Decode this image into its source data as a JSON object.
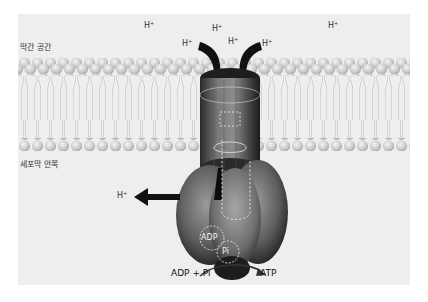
{
  "diagram": {
    "type": "ATP synthase in membrane",
    "regions": {
      "intermembrane_space": "막간 공간",
      "matrix_side": "세포막 안쪽"
    },
    "protons": [
      {
        "id": "h1",
        "label": "H",
        "charge": "+",
        "x": 146,
        "y": 26
      },
      {
        "id": "h2",
        "label": "H",
        "charge": "+",
        "x": 184,
        "y": 44
      },
      {
        "id": "h3",
        "label": "H",
        "charge": "+",
        "x": 214,
        "y": 29
      },
      {
        "id": "h4",
        "label": "H",
        "charge": "+",
        "x": 229,
        "y": 41
      },
      {
        "id": "h5",
        "label": "H",
        "charge": "+",
        "x": 262,
        "y": 44
      },
      {
        "id": "h6",
        "label": "H",
        "charge": "+",
        "x": 328,
        "y": 26
      },
      {
        "id": "h7",
        "label": "H",
        "charge": "+",
        "x": 117,
        "y": 190
      }
    ],
    "molecules": {
      "adp_inner": "ADP",
      "pi_inner": "Pi",
      "substrate": "ADP + Pi",
      "product": "ATP"
    },
    "colors": {
      "background": "#ffffff",
      "panel": "#eeeeee",
      "membrane_head": "#cfcfcf",
      "membrane_tail": "#bdbdbd",
      "enzyme_dark": "#2a2a2a",
      "enzyme_mid": "#6b6b6b",
      "enzyme_light": "#9a9a9a",
      "arrow": "#111111",
      "text": "#333333"
    }
  }
}
